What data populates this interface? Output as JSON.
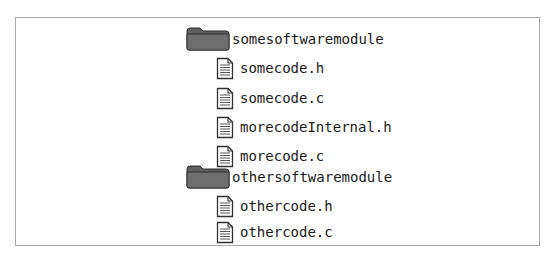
{
  "tree": {
    "folders": [
      {
        "name": "somesoftwaremodule",
        "icon": "folder-icon",
        "files": [
          {
            "name": "somecode.h",
            "icon": "file-icon"
          },
          {
            "name": "somecode.c",
            "icon": "file-icon"
          },
          {
            "name": "morecodeInternal.h",
            "icon": "file-icon"
          },
          {
            "name": "morecode.c",
            "icon": "file-icon"
          }
        ]
      },
      {
        "name": "othersoftwaremodule",
        "icon": "folder-icon",
        "files": [
          {
            "name": "othercode.h",
            "icon": "file-icon"
          },
          {
            "name": "othercode.c",
            "icon": "file-icon"
          }
        ]
      }
    ]
  },
  "colors": {
    "folder_fill": "#6b6b6b",
    "folder_tab": "#5a5a5a",
    "file_outline": "#333333",
    "frame_border": "#a9a9a9"
  }
}
